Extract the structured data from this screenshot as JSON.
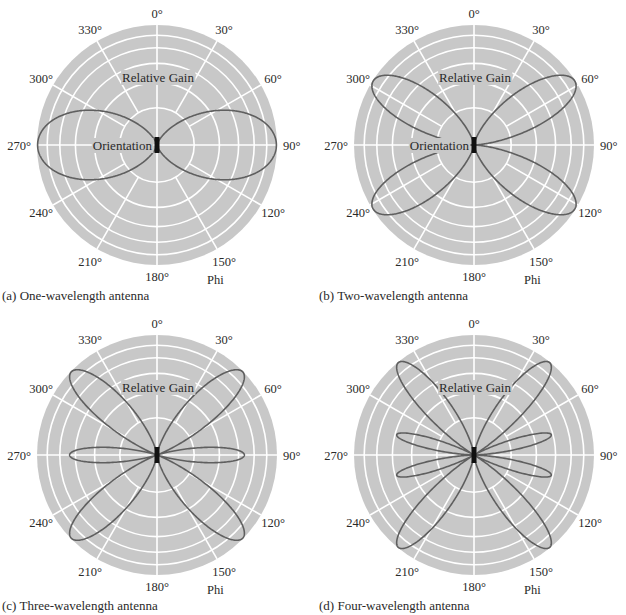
{
  "figure": {
    "background": "#ffffff",
    "disk_color": "#c8c8c8",
    "grid_color": "#ffffff",
    "curve_color": "#5f5f5f",
    "element_color": "#111111"
  },
  "panels": [
    {
      "id": "a",
      "caption": "(a)  One-wavelength antenna",
      "n": 1,
      "show_orientation": true
    },
    {
      "id": "b",
      "caption": "(b)  Two-wavelength antenna",
      "n": 2,
      "show_orientation": true
    },
    {
      "id": "c",
      "caption": "(c)  Three-wavelength antenna",
      "n": 3,
      "show_orientation": false
    },
    {
      "id": "d",
      "caption": "(d)  Four-wavelength antenna",
      "n": 4,
      "show_orientation": false
    }
  ],
  "labels": {
    "relative_gain": "Relative Gain",
    "orientation": "Orientation",
    "phi": "Phi"
  },
  "chart_data": [
    {
      "type": "polar-line",
      "title": "(a) One-wavelength antenna",
      "angular_ticks": [
        "0°",
        "30°",
        "60°",
        "90°",
        "120°",
        "150°",
        "180°",
        "210°",
        "240°",
        "270°",
        "300°",
        "330°"
      ],
      "radial_grid_fractions": [
        0.31,
        0.52,
        0.68,
        0.81,
        0.915,
        1.0
      ],
      "angular_label": "Phi",
      "radial_label": "Relative Gain",
      "series": [
        {
          "name": "Radiation pattern",
          "lobes": 2,
          "main_lobe_directions_deg": [
            90,
            270
          ],
          "peak_relative_gain": 1.0
        }
      ],
      "annotation": "Orientation"
    },
    {
      "type": "polar-line",
      "title": "(b) Two-wavelength antenna",
      "angular_ticks": [
        "0°",
        "30°",
        "60°",
        "90°",
        "120°",
        "150°",
        "180°",
        "210°",
        "240°",
        "270°",
        "300°",
        "330°"
      ],
      "radial_grid_fractions": [
        0.31,
        0.52,
        0.68,
        0.81,
        0.915,
        1.0
      ],
      "angular_label": "Phi",
      "radial_label": "Relative Gain",
      "series": [
        {
          "name": "Radiation pattern",
          "lobes": 4,
          "main_lobe_directions_deg": [
            58,
            122,
            238,
            302
          ],
          "peak_relative_gain": 1.0
        }
      ],
      "annotation": "Orientation"
    },
    {
      "type": "polar-line",
      "title": "(c) Three-wavelength antenna",
      "angular_ticks": [
        "0°",
        "30°",
        "60°",
        "90°",
        "120°",
        "150°",
        "180°",
        "210°",
        "240°",
        "270°",
        "300°",
        "330°"
      ],
      "radial_grid_fractions": [
        0.31,
        0.52,
        0.68,
        0.81,
        0.915,
        1.0
      ],
      "angular_label": "Phi",
      "radial_label": "Relative Gain",
      "series": [
        {
          "name": "Radiation pattern",
          "lobes": 6,
          "main_lobe_directions_deg": [
            42,
            90,
            138,
            222,
            270,
            318
          ],
          "peak_relative_gain": 1.0
        }
      ]
    },
    {
      "type": "polar-line",
      "title": "(d) Four-wavelength antenna",
      "angular_ticks": [
        "0°",
        "30°",
        "60°",
        "90°",
        "120°",
        "150°",
        "180°",
        "210°",
        "240°",
        "270°",
        "300°",
        "330°"
      ],
      "radial_grid_fractions": [
        0.31,
        0.52,
        0.68,
        0.81,
        0.915,
        1.0
      ],
      "angular_label": "Phi",
      "radial_label": "Relative Gain",
      "series": [
        {
          "name": "Radiation pattern",
          "lobes": 8,
          "main_lobe_directions_deg": [
            36,
            74,
            106,
            144,
            216,
            254,
            286,
            324
          ],
          "peak_relative_gain": 1.0
        }
      ]
    }
  ]
}
